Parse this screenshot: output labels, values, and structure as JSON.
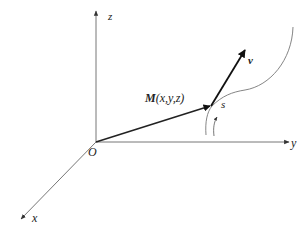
{
  "diagram": {
    "type": "3d-coordinate-vector-diagram",
    "axes": {
      "x": {
        "label": "x"
      },
      "y": {
        "label": "y"
      },
      "z": {
        "label": "z"
      }
    },
    "origin": {
      "label": "O"
    },
    "point": {
      "label_bold": "M",
      "label_rest": "(x,y,z)"
    },
    "velocity": {
      "label": "v"
    },
    "arc_length": {
      "label": "s"
    },
    "colors": {
      "axis": "#555555",
      "vector": "#222222",
      "curve": "#666666",
      "text": "#222222"
    }
  }
}
